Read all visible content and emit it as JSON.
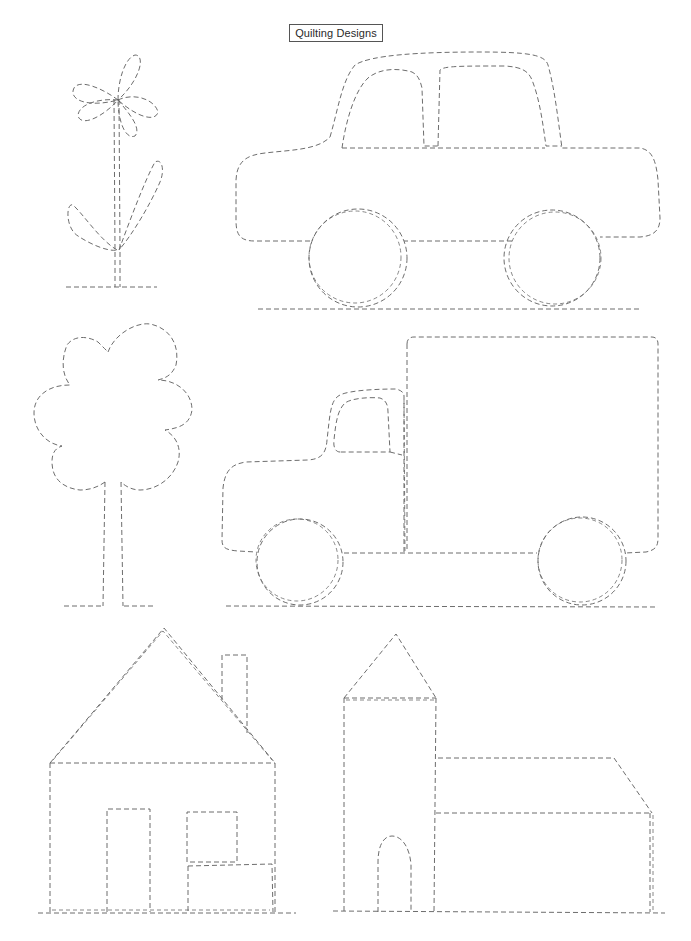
{
  "header": {
    "title": "Quilting Designs"
  },
  "designs": [
    {
      "name": "flower",
      "row": 1,
      "position": "left"
    },
    {
      "name": "car",
      "row": 1,
      "position": "right"
    },
    {
      "name": "tree",
      "row": 2,
      "position": "left"
    },
    {
      "name": "truck",
      "row": 2,
      "position": "right"
    },
    {
      "name": "house",
      "row": 3,
      "position": "left"
    },
    {
      "name": "church",
      "row": 3,
      "position": "right"
    }
  ],
  "style": {
    "line_color": "#5c5c5c",
    "background": "#ffffff",
    "line_style": "dashed"
  }
}
